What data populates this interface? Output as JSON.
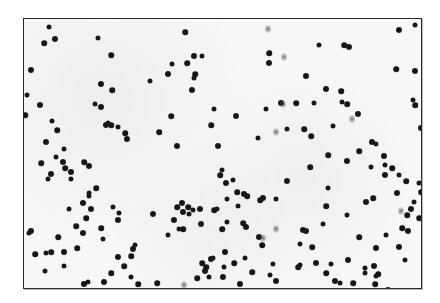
{
  "image": {
    "description": "Grayscale micrograph of dark round particles scattered on a light speckled background, enclosed in a thin dark rectangular frame",
    "colors": {
      "background": "#ffffff",
      "field": "#f7f7f7",
      "frame_border": "#2a2a2a",
      "particle": "#111111"
    },
    "frame": {
      "left": 23,
      "top": 18,
      "right": 422,
      "bottom": 289
    },
    "particles": [
      [
        48,
        26
      ],
      [
        43,
        42
      ],
      [
        54,
        38
      ],
      [
        97,
        37
      ],
      [
        184,
        31
      ],
      [
        30,
        69
      ],
      [
        26,
        94
      ],
      [
        24,
        114
      ],
      [
        39,
        104
      ],
      [
        51,
        120
      ],
      [
        56,
        129
      ],
      [
        45,
        141
      ],
      [
        63,
        148
      ],
      [
        110,
        54
      ],
      [
        100,
        83
      ],
      [
        94,
        103
      ],
      [
        111,
        89
      ],
      [
        100,
        106
      ],
      [
        107,
        122
      ],
      [
        110,
        124
      ],
      [
        105,
        124
      ],
      [
        117,
        126
      ],
      [
        124,
        132
      ],
      [
        126,
        138
      ],
      [
        149,
        80
      ],
      [
        158,
        131
      ],
      [
        167,
        73
      ],
      [
        171,
        63
      ],
      [
        186,
        62
      ],
      [
        193,
        55
      ],
      [
        193,
        77
      ],
      [
        194,
        73
      ],
      [
        191,
        89
      ],
      [
        201,
        55
      ],
      [
        170,
        115
      ],
      [
        176,
        145
      ],
      [
        213,
        108
      ],
      [
        210,
        124
      ],
      [
        217,
        145
      ],
      [
        221,
        169
      ],
      [
        219,
        174
      ],
      [
        225,
        182
      ],
      [
        232,
        179
      ],
      [
        236,
        191
      ],
      [
        243,
        193
      ],
      [
        237,
        205
      ],
      [
        246,
        195
      ],
      [
        235,
        115
      ],
      [
        257,
        137
      ],
      [
        268,
        52
      ],
      [
        268,
        62
      ],
      [
        265,
        108
      ],
      [
        295,
        102
      ],
      [
        305,
        75
      ],
      [
        318,
        44
      ],
      [
        343,
        44
      ],
      [
        348,
        46
      ],
      [
        341,
        101
      ],
      [
        340,
        90
      ],
      [
        325,
        88
      ],
      [
        313,
        102
      ],
      [
        346,
        103
      ],
      [
        357,
        113
      ],
      [
        332,
        125
      ],
      [
        310,
        135
      ],
      [
        371,
        141
      ],
      [
        375,
        143
      ],
      [
        358,
        150
      ],
      [
        398,
        29
      ],
      [
        414,
        24
      ],
      [
        395,
        68
      ],
      [
        414,
        70
      ],
      [
        412,
        99
      ],
      [
        414,
        104
      ],
      [
        420,
        127
      ],
      [
        286,
        128
      ],
      [
        303,
        128
      ],
      [
        280,
        102
      ],
      [
        370,
        166
      ],
      [
        391,
        167
      ],
      [
        384,
        174
      ],
      [
        398,
        174
      ],
      [
        405,
        180
      ],
      [
        396,
        192
      ],
      [
        418,
        182
      ],
      [
        406,
        214
      ],
      [
        410,
        208
      ],
      [
        413,
        201
      ],
      [
        420,
        191
      ],
      [
        407,
        230
      ],
      [
        404,
        259
      ],
      [
        418,
        217
      ],
      [
        383,
        155
      ],
      [
        384,
        164
      ],
      [
        327,
        154
      ],
      [
        346,
        160
      ],
      [
        327,
        187
      ],
      [
        372,
        197
      ],
      [
        365,
        201
      ],
      [
        346,
        214
      ],
      [
        309,
        166
      ],
      [
        286,
        180
      ],
      [
        275,
        198
      ],
      [
        259,
        199
      ],
      [
        262,
        197
      ],
      [
        272,
        263
      ],
      [
        261,
        244
      ],
      [
        258,
        236
      ],
      [
        226,
        198
      ],
      [
        242,
        222
      ],
      [
        245,
        226
      ],
      [
        226,
        221
      ],
      [
        221,
        228
      ],
      [
        181,
        202
      ],
      [
        192,
        209
      ],
      [
        176,
        206
      ],
      [
        182,
        211
      ],
      [
        188,
        213
      ],
      [
        187,
        206
      ],
      [
        199,
        208
      ],
      [
        216,
        208
      ],
      [
        213,
        209
      ],
      [
        173,
        219
      ],
      [
        178,
        228
      ],
      [
        182,
        228
      ],
      [
        200,
        223
      ],
      [
        167,
        234
      ],
      [
        201,
        262
      ],
      [
        222,
        276
      ],
      [
        223,
        266
      ],
      [
        233,
        262
      ],
      [
        224,
        251
      ],
      [
        212,
        257
      ],
      [
        205,
        266
      ],
      [
        204,
        270
      ],
      [
        208,
        276
      ],
      [
        196,
        277
      ],
      [
        210,
        258
      ],
      [
        244,
        257
      ],
      [
        205,
        291
      ],
      [
        239,
        283
      ],
      [
        269,
        274
      ],
      [
        251,
        271
      ],
      [
        275,
        280
      ],
      [
        299,
        243
      ],
      [
        297,
        266
      ],
      [
        305,
        230
      ],
      [
        322,
        223
      ],
      [
        325,
        205
      ],
      [
        347,
        259
      ],
      [
        364,
        267
      ],
      [
        358,
        236
      ],
      [
        373,
        265
      ],
      [
        375,
        275
      ],
      [
        377,
        273
      ],
      [
        302,
        229
      ],
      [
        299,
        264
      ],
      [
        311,
        246
      ],
      [
        315,
        262
      ],
      [
        330,
        263
      ],
      [
        325,
        272
      ],
      [
        334,
        280
      ],
      [
        339,
        282
      ],
      [
        352,
        282
      ],
      [
        375,
        247
      ],
      [
        385,
        234
      ],
      [
        401,
        227
      ],
      [
        398,
        246
      ],
      [
        364,
        272
      ],
      [
        374,
        283
      ],
      [
        387,
        289
      ],
      [
        28,
        232
      ],
      [
        34,
        253
      ],
      [
        30,
        230
      ],
      [
        45,
        252
      ],
      [
        50,
        251
      ],
      [
        63,
        251
      ],
      [
        44,
        270
      ],
      [
        57,
        236
      ],
      [
        82,
        232
      ],
      [
        63,
        265
      ],
      [
        76,
        247
      ],
      [
        83,
        283
      ],
      [
        87,
        281
      ],
      [
        123,
        265
      ],
      [
        117,
        256
      ],
      [
        134,
        244
      ],
      [
        130,
        255
      ],
      [
        132,
        248
      ],
      [
        102,
        238
      ],
      [
        100,
        227
      ],
      [
        117,
        219
      ],
      [
        118,
        212
      ],
      [
        110,
        272
      ],
      [
        103,
        281
      ],
      [
        130,
        276
      ],
      [
        137,
        283
      ],
      [
        152,
        213
      ],
      [
        112,
        206
      ],
      [
        85,
        217
      ],
      [
        90,
        208
      ],
      [
        88,
        195
      ],
      [
        95,
        187
      ],
      [
        82,
        202
      ],
      [
        68,
        208
      ],
      [
        75,
        225
      ],
      [
        88,
        165
      ],
      [
        88,
        192
      ],
      [
        83,
        161
      ],
      [
        62,
        161
      ],
      [
        55,
        156
      ],
      [
        64,
        167
      ],
      [
        70,
        171
      ],
      [
        70,
        178
      ],
      [
        40,
        162
      ],
      [
        50,
        173
      ],
      [
        47,
        178
      ],
      [
        156,
        282
      ],
      [
        155,
        291
      ]
    ],
    "smudges": [
      [
        267,
        28
      ],
      [
        283,
        56
      ],
      [
        282,
        103
      ],
      [
        275,
        131
      ],
      [
        351,
        118
      ],
      [
        400,
        210
      ],
      [
        262,
        237
      ],
      [
        275,
        228
      ],
      [
        183,
        284
      ]
    ]
  }
}
